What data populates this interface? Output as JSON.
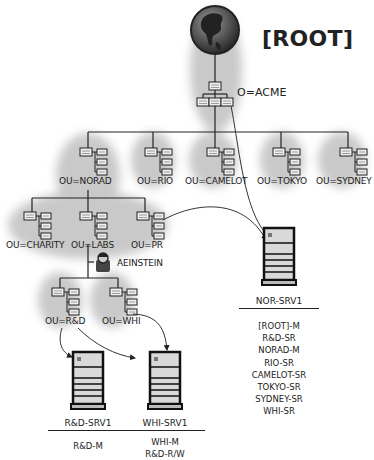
{
  "diagram": {
    "title": "[ROOT]",
    "organization": "O=ACME",
    "top_level_ous": [
      {
        "label": "OU=NORAD"
      },
      {
        "label": "OU=RIO"
      },
      {
        "label": "OU=CAMELOT"
      },
      {
        "label": "OU=TOKYO"
      },
      {
        "label": "OU=SYDNEY"
      }
    ],
    "norad_children": [
      {
        "label": "OU=CHARITY"
      },
      {
        "label": "OU=LABS"
      },
      {
        "label": "OU=PR"
      }
    ],
    "user": {
      "label": "AEINSTEIN",
      "icon": "user-icon"
    },
    "labs_children": [
      {
        "label": "OU=R&D"
      },
      {
        "label": "OU=WHI"
      }
    ],
    "servers": [
      {
        "name": "NOR-SRV1",
        "replicas": [
          "[ROOT]-M",
          "R&D-SR",
          "NORAD-M",
          "RIO-SR",
          "CAMELOT-SR",
          "TOKYO-SR",
          "SYDNEY-SR",
          "WHI-SR"
        ]
      },
      {
        "name": "R&D-SRV1",
        "replicas": [
          "R&D-M"
        ]
      },
      {
        "name": "WHI-SRV1",
        "replicas": [
          "WHI-M",
          "R&D-R/W"
        ]
      }
    ],
    "colors": {
      "halo": "#c8c8c8",
      "line": "#333333",
      "server_body": "#d9d9d9",
      "globe_ocean": "#555555",
      "globe_land": "#222222"
    }
  }
}
